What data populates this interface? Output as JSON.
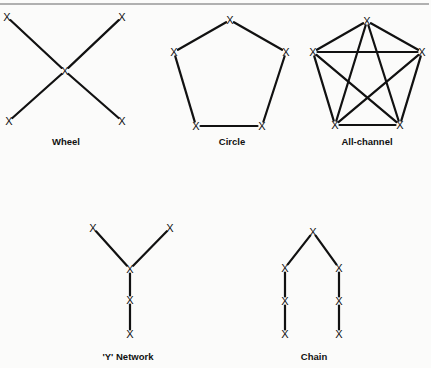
{
  "diagram": {
    "node_symbol": "X",
    "networks": [
      {
        "id": "wheel",
        "label": "Wheel",
        "label_pos": [
          66,
          145
        ],
        "nodes": [
          [
            7,
            17
          ],
          [
            122,
            17
          ],
          [
            65,
            71
          ],
          [
            9,
            121
          ],
          [
            122,
            121
          ]
        ],
        "edges": [
          [
            0,
            2
          ],
          [
            1,
            2
          ],
          [
            3,
            2
          ],
          [
            4,
            2
          ]
        ]
      },
      {
        "id": "circle",
        "label": "Circle",
        "label_pos": [
          232,
          145
        ],
        "nodes": [
          [
            230,
            20
          ],
          [
            174,
            52
          ],
          [
            286,
            52
          ],
          [
            196,
            126
          ],
          [
            262,
            126
          ]
        ],
        "edges": [
          [
            0,
            1
          ],
          [
            0,
            2
          ],
          [
            1,
            3
          ],
          [
            2,
            4
          ],
          [
            3,
            4
          ]
        ]
      },
      {
        "id": "all-channel",
        "label": "All-channel",
        "label_pos": [
          367,
          145
        ],
        "nodes": [
          [
            367,
            21
          ],
          [
            313,
            52
          ],
          [
            422,
            52
          ],
          [
            335,
            125
          ],
          [
            400,
            125
          ]
        ],
        "edges": [
          [
            0,
            1
          ],
          [
            0,
            2
          ],
          [
            0,
            3
          ],
          [
            0,
            4
          ],
          [
            1,
            2
          ],
          [
            1,
            3
          ],
          [
            1,
            4
          ],
          [
            2,
            3
          ],
          [
            2,
            4
          ],
          [
            3,
            4
          ]
        ]
      },
      {
        "id": "y-network",
        "label": "'Y' Network",
        "label_pos": [
          128,
          360
        ],
        "nodes": [
          [
            93,
            228
          ],
          [
            170,
            228
          ],
          [
            130,
            269
          ],
          [
            130,
            300
          ],
          [
            130,
            334
          ]
        ],
        "edges": [
          [
            0,
            2
          ],
          [
            1,
            2
          ],
          [
            2,
            3
          ],
          [
            3,
            4
          ]
        ]
      },
      {
        "id": "chain",
        "label": "Chain",
        "label_pos": [
          314,
          360
        ],
        "nodes": [
          [
            313,
            232
          ],
          [
            285,
            268
          ],
          [
            285,
            301
          ],
          [
            285,
            334
          ],
          [
            339,
            268
          ],
          [
            339,
            301
          ],
          [
            339,
            334
          ]
        ],
        "edges": [
          [
            0,
            1
          ],
          [
            1,
            2
          ],
          [
            2,
            3
          ],
          [
            0,
            4
          ],
          [
            4,
            5
          ],
          [
            5,
            6
          ]
        ]
      }
    ]
  }
}
